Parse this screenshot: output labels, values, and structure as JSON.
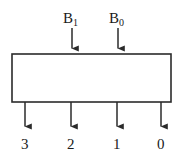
{
  "diagram": {
    "type": "logic-block-diagram",
    "block": {
      "name": "decoder-block",
      "label": "",
      "x": 12,
      "y": 54,
      "width": 159,
      "height": 48,
      "stroke_color": "#2b2b2b",
      "fill_color": "#ffffff",
      "stroke_width": 1.6
    },
    "inputs": [
      {
        "label": "B",
        "subscript": "1",
        "x": 72,
        "arrow_from_y": 28,
        "arrow_to_y": 54
      },
      {
        "label": "B",
        "subscript": "0",
        "x": 118,
        "arrow_from_y": 28,
        "arrow_to_y": 54
      }
    ],
    "outputs": [
      {
        "label": "3",
        "x": 25,
        "arrow_from_y": 102,
        "arrow_to_y": 132
      },
      {
        "label": "2",
        "x": 71,
        "arrow_from_y": 102,
        "arrow_to_y": 132
      },
      {
        "label": "1",
        "x": 117,
        "arrow_from_y": 102,
        "arrow_to_y": 132
      },
      {
        "label": "0",
        "x": 161,
        "arrow_from_y": 102,
        "arrow_to_y": 132
      }
    ],
    "colors": {
      "line": "#2b2b2b",
      "text": "#1a1a1a",
      "background": "#ffffff"
    }
  }
}
